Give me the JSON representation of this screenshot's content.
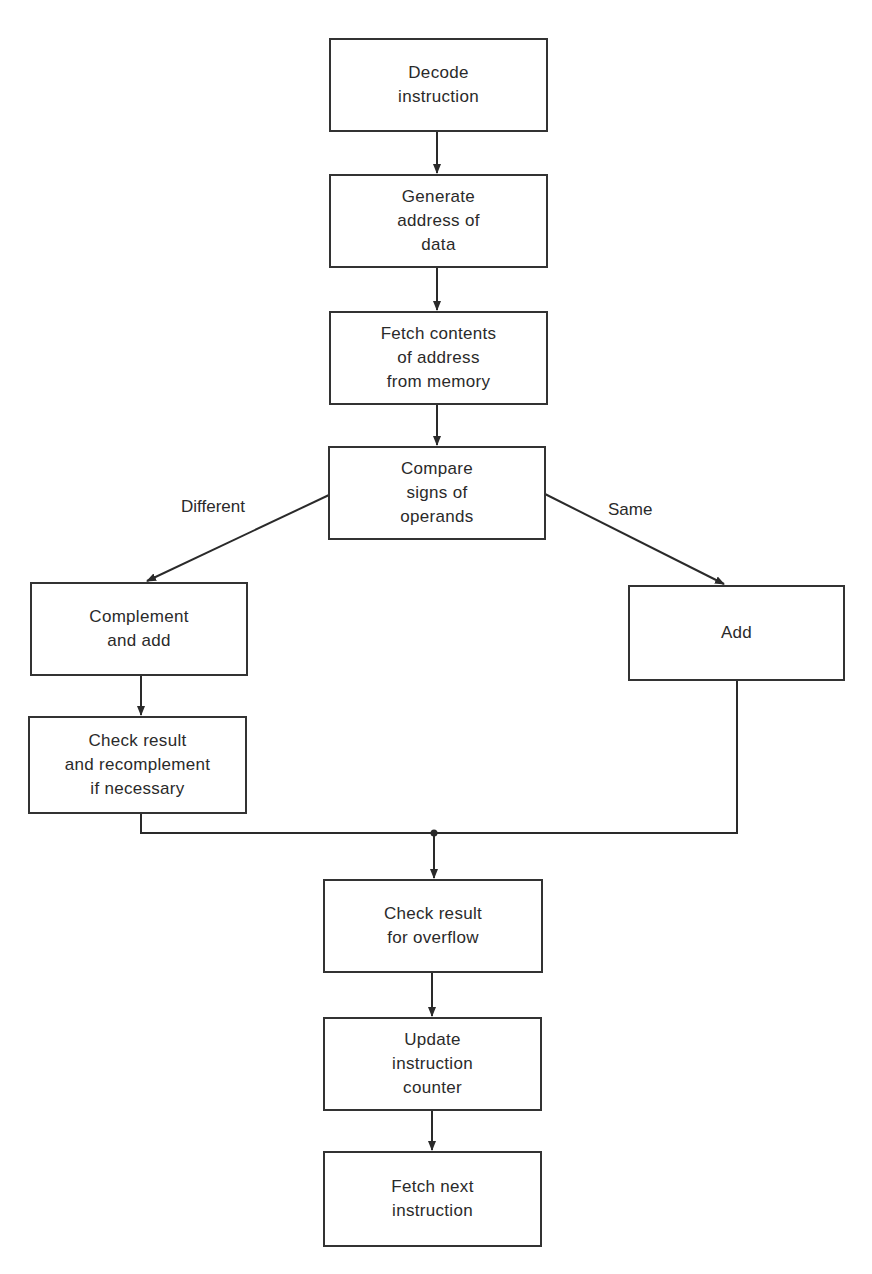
{
  "diagram": {
    "type": "flowchart",
    "nodes": [
      {
        "id": "decode",
        "label": "Decode\ninstruction"
      },
      {
        "id": "gen_addr",
        "label": "Generate\naddress of\ndata"
      },
      {
        "id": "fetch_contents",
        "label": "Fetch contents\nof address\nfrom memory"
      },
      {
        "id": "compare",
        "label": "Compare\nsigns of\noperands"
      },
      {
        "id": "complement",
        "label": "Complement\nand add"
      },
      {
        "id": "add",
        "label": "Add"
      },
      {
        "id": "check_recomp",
        "label": "Check result\nand recomplement\nif necessary"
      },
      {
        "id": "overflow",
        "label": "Check result\nfor overflow"
      },
      {
        "id": "update",
        "label": "Update\ninstruction\ncounter"
      },
      {
        "id": "fetch_next",
        "label": "Fetch next\ninstruction"
      }
    ],
    "edge_labels": {
      "different": "Different",
      "same": "Same"
    },
    "edges": [
      {
        "from": "decode",
        "to": "gen_addr"
      },
      {
        "from": "gen_addr",
        "to": "fetch_contents"
      },
      {
        "from": "fetch_contents",
        "to": "compare"
      },
      {
        "from": "compare",
        "to": "complement",
        "label": "Different"
      },
      {
        "from": "compare",
        "to": "add",
        "label": "Same"
      },
      {
        "from": "complement",
        "to": "check_recomp"
      },
      {
        "from": "check_recomp",
        "to": "overflow"
      },
      {
        "from": "add",
        "to": "overflow"
      },
      {
        "from": "overflow",
        "to": "update"
      },
      {
        "from": "update",
        "to": "fetch_next"
      }
    ]
  }
}
